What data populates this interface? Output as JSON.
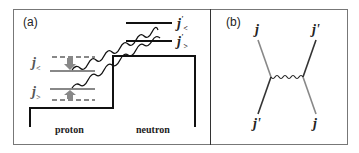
{
  "panels": {
    "a": {
      "label": "(a)",
      "left_well_label": "proton",
      "right_well_label": "neutron",
      "proton_levels": [
        {
          "symbol": "j",
          "sub": "<"
        },
        {
          "symbol": "j",
          "sub": ">"
        }
      ],
      "neutron_levels": [
        {
          "symbol": "j",
          "sup": "'",
          "sub": "<"
        },
        {
          "symbol": "j",
          "sup": "'",
          "sub": ">"
        }
      ]
    },
    "b": {
      "label": "(b)",
      "top_left": "j",
      "top_right": "j'",
      "bottom_left": "j'",
      "bottom_right": "j"
    }
  },
  "colors": {
    "line_dark": "#111111",
    "line_gray": "#888888",
    "frame": "#777777"
  }
}
